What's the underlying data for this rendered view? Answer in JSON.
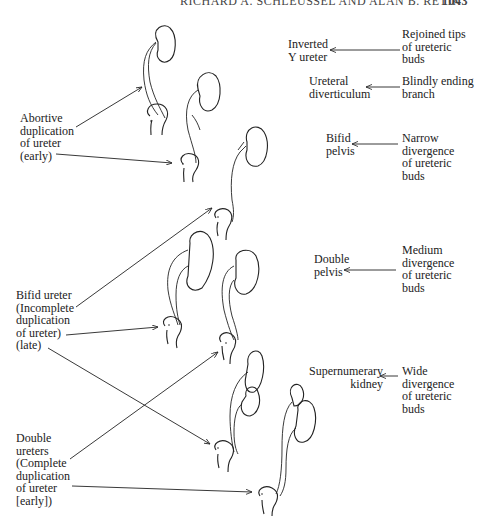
{
  "header": {
    "running_head": "RICHARD A. SCHLEUSSEL AND ALAN B. RETIK",
    "page_number": "1043"
  },
  "left_labels": {
    "abortive": "Abortive\nduplication\nof ureter\n(early)",
    "bifid": "Bifid ureter\n(Incomplete\nduplication\nof ureter)\n(late)",
    "double": "Double\nureters\n(Complete\nduplication\nof ureter\n[early])"
  },
  "right_rows": [
    {
      "result": "Inverted\nY ureter",
      "cause": "Rejoined tips\nof ureteric\nbuds"
    },
    {
      "result": "Ureteral\ndiverticulum",
      "cause": "Blindly ending\nbranch"
    },
    {
      "result": "Bifid\npelvis",
      "cause": "Narrow\ndivergence\nof ureteric\nbuds"
    },
    {
      "result": "Double\npelvis",
      "cause": "Medium\ndivergence\nof ureteric\nbuds"
    },
    {
      "result": "Supernumerary\nkidney",
      "cause": "Wide\ndivergence\nof ureteric\nbuds"
    }
  ]
}
